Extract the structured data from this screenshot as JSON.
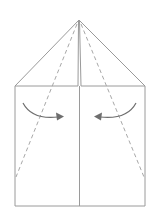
{
  "diagram": {
    "colors": {
      "background": "#ffffff",
      "line": "#9a9a9a",
      "dash": "#a8a8a8",
      "arrow": "#6e6e6e"
    },
    "shapes": {
      "apex": [
        79,
        20
      ],
      "square": {
        "left": 15,
        "right": 145,
        "top": 86,
        "bottom": 206
      },
      "center_x": 79,
      "center_gap": 2
    },
    "fold_lines": [
      {
        "type": "valley",
        "style": "dashed",
        "from": [
          78,
          22
        ],
        "to": [
          16,
          177
        ]
      },
      {
        "type": "valley",
        "style": "dashed",
        "from": [
          80,
          22
        ],
        "to": [
          144,
          177
        ]
      }
    ],
    "arrows": [
      {
        "direction": "right",
        "label": "fold left flap to center"
      },
      {
        "direction": "left",
        "label": "fold right flap to center"
      }
    ]
  }
}
